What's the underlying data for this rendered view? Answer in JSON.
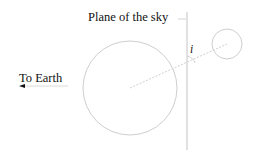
{
  "diagram": {
    "labels": {
      "plane_of_sky": "Plane of the sky",
      "to_earth": "To Earth",
      "inclination": "i"
    },
    "colors": {
      "stroke": "#c8c8c8",
      "text": "#111111",
      "background": "#ffffff"
    },
    "shapes": {
      "large_circle": {
        "cx": 130,
        "cy": 88,
        "r": 47
      },
      "small_circle": {
        "cx": 227,
        "cy": 44,
        "r": 15
      },
      "plane_line": {
        "x": 187,
        "y1": 12,
        "y2": 150
      },
      "line_of_sight": {
        "x1": 130,
        "y1": 88,
        "x2": 227,
        "y2": 44,
        "dashed": true
      }
    }
  }
}
